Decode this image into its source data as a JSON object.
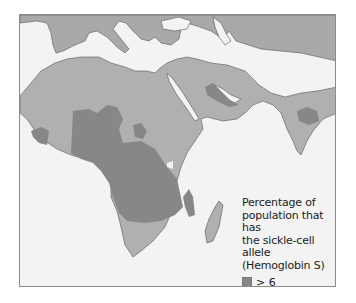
{
  "map": {
    "colors": {
      "sea": "#f3f3f3",
      "land_base": "#a9a9a9",
      "level_2_6": "#b3b3b3",
      "level_gt6": "#878787",
      "border": "#555555"
    },
    "regions_shown": [
      "Southern Europe",
      "Africa",
      "Middle East",
      "Arabian Peninsula",
      "Indian Subcontinent",
      "Madagascar"
    ]
  },
  "legend": {
    "title": "Percentage of population that has the sickle-cell allele (Hemoglobin S)",
    "title_lines": [
      "Percentage of",
      "population that has",
      "the sickle-cell allele",
      "(Hemoglobin S)"
    ],
    "items": [
      {
        "label": "> 6",
        "color": "#878787"
      },
      {
        "label": "2–6",
        "color": "#b8b8b8"
      }
    ]
  }
}
